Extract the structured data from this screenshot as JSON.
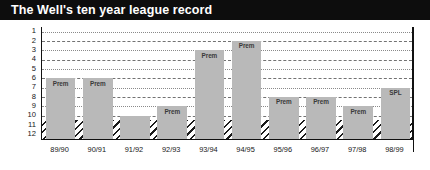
{
  "header": {
    "title": "The Well's ten year league record"
  },
  "chart_data": {
    "type": "bar",
    "title": "The Well's ten year league record",
    "xlabel": "",
    "ylabel": "",
    "ylim": [
      1,
      12
    ],
    "y_inverted": true,
    "grid": true,
    "legend": "none",
    "y_ticks": [
      "1",
      "2",
      "3",
      "4",
      "5",
      "6",
      "7",
      "8",
      "9",
      "10",
      "11",
      "12"
    ],
    "categories": [
      "89/90",
      "90/91",
      "91/92",
      "92/93",
      "93/94",
      "94/95",
      "95/96",
      "96/97",
      "97/98",
      "98/99"
    ],
    "values": [
      6,
      6,
      10,
      9,
      3,
      2,
      8,
      8,
      9,
      7
    ],
    "point_labels": [
      "Prem",
      "Prem",
      "",
      "Prem",
      "Prem",
      "Prem",
      "Prem",
      "Prem",
      "Prem",
      "SPL"
    ],
    "annotations": {
      "relegation_band": {
        "from": 10.5,
        "to": 12,
        "style": "diagonal-hatch"
      }
    }
  },
  "colors": {
    "banner": "#0d0d0d",
    "banner_text": "#ffffff",
    "bar_fill": "#b9b9b9",
    "axis": "#111111",
    "gridline": "#5a5a5a",
    "hatch": "#1a1a1a"
  }
}
